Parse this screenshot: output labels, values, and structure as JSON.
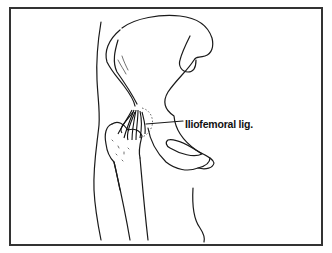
{
  "figure": {
    "labels": [
      {
        "text": "Iliofemoral lig.",
        "target": "iliofemoral-ligament"
      }
    ]
  },
  "colors": {
    "line": "#1a1a1a",
    "border": "#333333",
    "background": "#ffffff"
  }
}
